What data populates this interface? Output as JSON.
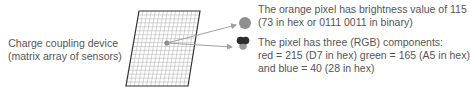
{
  "sensor_label": {
    "line1": "Charge coupling device",
    "line2": "(matrix array of sensors)"
  },
  "brightness_note": {
    "line1": "The orange pixel has brightness value of 115",
    "line2": "(73 in hex or 0111 0011 in binary)"
  },
  "rgb_note": {
    "line1": "The pixel has three (RGB) components:",
    "line2": "red = 215 (D7 in hex)  green = 165 (A5 in hex)",
    "line3": "and blue = 40 (28 in hex)"
  },
  "grid": {
    "columns": 15,
    "rows": 19
  },
  "colors": {
    "grid_line": "#b8b8b8",
    "grid_border": "#333333",
    "pixel_dot": "#8a8a8a",
    "brightness_circle": "#8f8f8f",
    "rgb_top": "#2e2e2e",
    "rgb_bottom": "#9a9a9a",
    "arrow": "#a0a0a0",
    "text": "#555555"
  }
}
